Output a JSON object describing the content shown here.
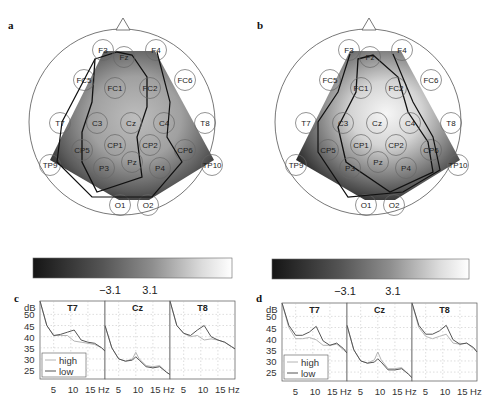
{
  "figure": {
    "panels": {
      "a": {
        "label": "a"
      },
      "b": {
        "label": "b"
      },
      "c": {
        "label": "c"
      },
      "d": {
        "label": "d"
      }
    },
    "colorbar": {
      "ticks": [
        "−3.1",
        "3.1"
      ]
    },
    "electrodes": [
      "F3",
      "Fz",
      "F4",
      "FC5",
      "FC1",
      "FC2",
      "FC6",
      "T7",
      "C3",
      "Cz",
      "C4",
      "T8",
      "CP5",
      "CP1",
      "CP2",
      "CP6",
      "TP9",
      "P3",
      "Pz",
      "P4",
      "TP10",
      "O1",
      "O2"
    ],
    "spectra": {
      "ylabel": "dB",
      "yticks": [
        "50",
        "45",
        "40",
        "35",
        "30",
        "25"
      ],
      "xticks": [
        "5",
        "10",
        "15 Hz"
      ],
      "channels": [
        "T7",
        "Cz",
        "T8"
      ],
      "legend": [
        "high",
        "low"
      ]
    }
  },
  "chart_data": [
    {
      "type": "heatmap",
      "title": "a",
      "description": "Scalp topography (grayscale t-map) with significance contour",
      "electrodes": [
        "F3",
        "Fz",
        "F4",
        "FC5",
        "FC1",
        "FC2",
        "FC6",
        "T7",
        "C3",
        "Cz",
        "C4",
        "T8",
        "CP5",
        "CP1",
        "CP2",
        "CP6",
        "TP9",
        "P3",
        "Pz",
        "P4",
        "TP10",
        "O1",
        "O2"
      ],
      "colorbar_ticks": [
        -3.1,
        3.1
      ]
    },
    {
      "type": "heatmap",
      "title": "b",
      "description": "Scalp topography (grayscale t-map) with significance contour",
      "electrodes": [
        "F3",
        "Fz",
        "F4",
        "FC5",
        "FC1",
        "FC2",
        "FC6",
        "T7",
        "C3",
        "Cz",
        "C4",
        "T8",
        "CP5",
        "CP1",
        "CP2",
        "CP6",
        "TP9",
        "P3",
        "Pz",
        "P4",
        "TP10",
        "O1",
        "O2"
      ],
      "colorbar_ticks": [
        -3.1,
        3.1
      ]
    },
    {
      "type": "line",
      "title": "c",
      "ylabel": "dB",
      "xlabel": "Hz",
      "xticks": [
        5,
        10,
        15
      ],
      "yticks": [
        25,
        30,
        35,
        40,
        45,
        50
      ],
      "ylim": [
        21,
        56
      ],
      "xlim": [
        1,
        20
      ],
      "grid": true,
      "legend": [
        "high",
        "low"
      ],
      "subplots": [
        {
          "channel": "T7",
          "x": [
            1,
            3,
            5,
            7,
            9,
            11,
            13,
            15,
            17,
            19,
            20
          ],
          "series": [
            {
              "name": "high",
              "values": [
                56,
                45,
                40.5,
                40.5,
                40.5,
                38,
                37.5,
                37,
                36.5,
                35,
                33.5
              ]
            },
            {
              "name": "low",
              "values": [
                56,
                45,
                40.5,
                41,
                42,
                43,
                38.5,
                37.5,
                37,
                35,
                33.5
              ]
            }
          ]
        },
        {
          "channel": "Cz",
          "x": [
            1,
            3,
            5,
            7,
            9,
            10,
            11,
            13,
            15,
            17,
            19,
            20
          ],
          "series": [
            {
              "name": "high",
              "values": [
                45,
                35,
                30,
                29,
                30,
                33,
                30,
                27,
                26.5,
                27,
                24,
                23
              ]
            },
            {
              "name": "low",
              "values": [
                45,
                35,
                30,
                29,
                29.5,
                31,
                29.5,
                26.5,
                26,
                26.5,
                24,
                23
              ]
            }
          ]
        },
        {
          "channel": "T8",
          "x": [
            1,
            3,
            5,
            7,
            9,
            11,
            13,
            15,
            17,
            19,
            20
          ],
          "series": [
            {
              "name": "high",
              "values": [
                56,
                45,
                41.5,
                40,
                40.5,
                38.5,
                39,
                38.5,
                37.5,
                35.5,
                34.5
              ]
            },
            {
              "name": "low",
              "values": [
                56,
                45,
                41.5,
                40.5,
                43,
                45,
                40,
                38.5,
                37.5,
                35.5,
                34.5
              ]
            }
          ]
        }
      ]
    },
    {
      "type": "line",
      "title": "d",
      "ylabel": "dB",
      "xlabel": "Hz",
      "xticks": [
        5,
        10,
        15
      ],
      "yticks": [
        25,
        30,
        35,
        40,
        45,
        50
      ],
      "ylim": [
        21,
        56
      ],
      "xlim": [
        1,
        20
      ],
      "grid": true,
      "legend": [
        "high",
        "low"
      ],
      "subplots": [
        {
          "channel": "T7",
          "x": [
            1,
            3,
            5,
            7,
            9,
            11,
            13,
            15,
            17,
            19,
            20
          ],
          "series": [
            {
              "name": "high",
              "values": [
                56,
                45,
                40,
                40,
                40.5,
                39.5,
                37,
                37,
                37.5,
                35,
                33.5
              ]
            },
            {
              "name": "low",
              "values": [
                56,
                46,
                41.5,
                41.5,
                43,
                45.5,
                39,
                37,
                38,
                35.5,
                33.5
              ]
            }
          ]
        },
        {
          "channel": "Cz",
          "x": [
            1,
            3,
            5,
            7,
            9,
            10,
            11,
            13,
            15,
            17,
            19,
            20
          ],
          "series": [
            {
              "name": "high",
              "values": [
                46,
                35,
                30,
                29,
                30.5,
                34,
                30.5,
                26.5,
                26.5,
                27,
                24,
                22.5
              ]
            },
            {
              "name": "low",
              "values": [
                46,
                35,
                30,
                29,
                29.5,
                31,
                29.5,
                26,
                26,
                26.5,
                24,
                22.5
              ]
            }
          ]
        },
        {
          "channel": "T8",
          "x": [
            1,
            3,
            5,
            7,
            9,
            11,
            13,
            15,
            17,
            19,
            20
          ],
          "series": [
            {
              "name": "high",
              "values": [
                56,
                45,
                41,
                40,
                41,
                42,
                38,
                37.5,
                38,
                35.5,
                34
              ]
            },
            {
              "name": "low",
              "values": [
                56,
                46,
                42,
                42,
                43.5,
                46,
                39.5,
                37.5,
                38,
                36,
                34
              ]
            }
          ]
        }
      ]
    }
  ]
}
